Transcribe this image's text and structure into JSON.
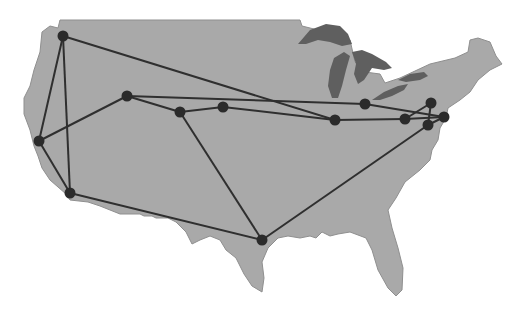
{
  "map": {
    "title": "US network map",
    "colors": {
      "land": "#a9a9a9",
      "land_stroke": "#8f8f8f",
      "lakes": "#5f5f5f",
      "edge": "#2f2f2f",
      "node": "#2b2b2b",
      "background": "#ffffff"
    },
    "nodes": [
      {
        "id": "seattle",
        "x": 63,
        "y": 36
      },
      {
        "id": "sanfrancisco",
        "x": 39,
        "y": 141
      },
      {
        "id": "losangeles",
        "x": 70,
        "y": 193
      },
      {
        "id": "saltlake",
        "x": 127,
        "y": 96
      },
      {
        "id": "denver",
        "x": 180,
        "y": 112
      },
      {
        "id": "lincoln",
        "x": 223,
        "y": 107
      },
      {
        "id": "houston",
        "x": 262,
        "y": 240
      },
      {
        "id": "chicago",
        "x": 335,
        "y": 120
      },
      {
        "id": "detroit",
        "x": 365,
        "y": 104
      },
      {
        "id": "pittsburgh",
        "x": 405,
        "y": 119
      },
      {
        "id": "ithaca",
        "x": 431,
        "y": 103
      },
      {
        "id": "newyork",
        "x": 444,
        "y": 117
      },
      {
        "id": "washington",
        "x": 428,
        "y": 125
      }
    ],
    "edges": [
      [
        "seattle",
        "sanfrancisco"
      ],
      [
        "seattle",
        "losangeles"
      ],
      [
        "seattle",
        "chicago"
      ],
      [
        "sanfrancisco",
        "losangeles"
      ],
      [
        "sanfrancisco",
        "saltlake"
      ],
      [
        "losangeles",
        "houston"
      ],
      [
        "saltlake",
        "denver"
      ],
      [
        "saltlake",
        "detroit"
      ],
      [
        "denver",
        "lincoln"
      ],
      [
        "denver",
        "houston"
      ],
      [
        "lincoln",
        "chicago"
      ],
      [
        "chicago",
        "pittsburgh"
      ],
      [
        "detroit",
        "newyork"
      ],
      [
        "pittsburgh",
        "ithaca"
      ],
      [
        "pittsburgh",
        "newyork"
      ],
      [
        "ithaca",
        "washington"
      ],
      [
        "newyork",
        "washington"
      ],
      [
        "houston",
        "washington"
      ]
    ]
  }
}
